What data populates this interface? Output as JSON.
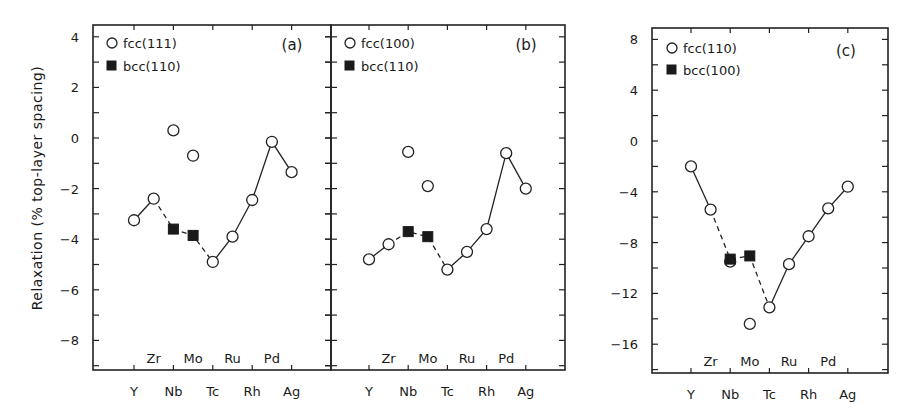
{
  "figure": {
    "ylabel": "Relaxation   (% top-layer spacing)"
  },
  "chart_data": [
    {
      "type": "scatter",
      "panel": "(a)",
      "title": "",
      "xlabel": "",
      "ylabel": "Relaxation (% top-layer spacing)",
      "x_categories_top_row": [
        "Zr",
        "Mo",
        "Ru",
        "Pd"
      ],
      "x_categories_bottom_row": [
        "Y",
        "Nb",
        "Tc",
        "Rh",
        "Ag"
      ],
      "element_order": [
        "Y",
        "Zr",
        "Nb",
        "Mo",
        "Tc",
        "Ru",
        "Rh",
        "Pd",
        "Ag"
      ],
      "yticks": [
        4,
        2,
        0,
        -2,
        -4,
        -6,
        -8
      ],
      "ylim": [
        -9.3,
        4.5
      ],
      "grid": false,
      "legend": [
        {
          "label": "fcc(111)",
          "marker": "open-circle"
        },
        {
          "label": "bcc(110)",
          "marker": "filled-square"
        }
      ],
      "series": [
        {
          "name": "fcc(111)",
          "marker": "open-circle",
          "points": [
            {
              "x": "Y",
              "y": -3.25
            },
            {
              "x": "Zr",
              "y": -2.4
            },
            {
              "x": "Nb",
              "y": 0.3
            },
            {
              "x": "Mo",
              "y": -0.7
            },
            {
              "x": "Tc",
              "y": -4.9
            },
            {
              "x": "Ru",
              "y": -3.9
            },
            {
              "x": "Rh",
              "y": -2.45
            },
            {
              "x": "Pd",
              "y": -0.15
            },
            {
              "x": "Ag",
              "y": -1.35
            }
          ]
        },
        {
          "name": "bcc(110)",
          "marker": "filled-square",
          "points": [
            {
              "x": "Nb",
              "y": -3.6
            },
            {
              "x": "Mo",
              "y": -3.85
            }
          ]
        }
      ],
      "lines": [
        {
          "style": "solid",
          "path": [
            [
              "Y",
              -3.25
            ],
            [
              "Zr",
              -2.4
            ]
          ]
        },
        {
          "style": "dashed",
          "path": [
            [
              "Zr",
              -2.4
            ],
            [
              "Nb",
              -3.6
            ],
            [
              "Mo",
              -3.85
            ],
            [
              "Tc",
              -4.9
            ]
          ]
        },
        {
          "style": "solid",
          "path": [
            [
              "Tc",
              -4.9
            ],
            [
              "Ru",
              -3.9
            ],
            [
              "Rh",
              -2.45
            ],
            [
              "Pd",
              -0.15
            ],
            [
              "Ag",
              -1.35
            ]
          ]
        }
      ]
    },
    {
      "type": "scatter",
      "panel": "(b)",
      "title": "",
      "xlabel": "",
      "ylabel": "",
      "x_categories_top_row": [
        "Zr",
        "Mo",
        "Ru",
        "Pd"
      ],
      "x_categories_bottom_row": [
        "Y",
        "Nb",
        "Tc",
        "Rh",
        "Ag"
      ],
      "element_order": [
        "Y",
        "Zr",
        "Nb",
        "Mo",
        "Tc",
        "Ru",
        "Rh",
        "Pd",
        "Ag"
      ],
      "yticks": [
        4,
        2,
        0,
        -2,
        -4,
        -6,
        -8
      ],
      "ylim": [
        -9.3,
        4.5
      ],
      "shares_y_with": "(a)",
      "grid": false,
      "legend": [
        {
          "label": "fcc(100)",
          "marker": "open-circle"
        },
        {
          "label": "bcc(110)",
          "marker": "filled-square"
        }
      ],
      "series": [
        {
          "name": "fcc(100)",
          "marker": "open-circle",
          "points": [
            {
              "x": "Y",
              "y": -4.8
            },
            {
              "x": "Zr",
              "y": -4.2
            },
            {
              "x": "Nb",
              "y": -0.55
            },
            {
              "x": "Mo",
              "y": -1.9
            },
            {
              "x": "Tc",
              "y": -5.2
            },
            {
              "x": "Ru",
              "y": -4.5
            },
            {
              "x": "Rh",
              "y": -3.6
            },
            {
              "x": "Pd",
              "y": -0.6
            },
            {
              "x": "Ag",
              "y": -2.0
            }
          ]
        },
        {
          "name": "bcc(110)",
          "marker": "filled-square",
          "points": [
            {
              "x": "Nb",
              "y": -3.7
            },
            {
              "x": "Mo",
              "y": -3.9
            }
          ]
        }
      ],
      "lines": [
        {
          "style": "solid",
          "path": [
            [
              "Y",
              -4.8
            ],
            [
              "Zr",
              -4.2
            ]
          ]
        },
        {
          "style": "dashed",
          "path": [
            [
              "Zr",
              -4.2
            ],
            [
              "Nb",
              -3.7
            ],
            [
              "Mo",
              -3.9
            ],
            [
              "Tc",
              -5.2
            ]
          ]
        },
        {
          "style": "solid",
          "path": [
            [
              "Tc",
              -5.2
            ],
            [
              "Ru",
              -4.5
            ],
            [
              "Rh",
              -3.6
            ],
            [
              "Pd",
              -0.6
            ],
            [
              "Ag",
              -2.0
            ]
          ]
        }
      ]
    },
    {
      "type": "scatter",
      "panel": "(c)",
      "title": "",
      "xlabel": "",
      "ylabel": "",
      "x_categories_top_row": [
        "Zr",
        "Mo",
        "Ru",
        "Pd"
      ],
      "x_categories_bottom_row": [
        "Y",
        "Nb",
        "Tc",
        "Rh",
        "Ag"
      ],
      "element_order": [
        "Y",
        "Zr",
        "Nb",
        "Mo",
        "Tc",
        "Ru",
        "Rh",
        "Pd",
        "Ag"
      ],
      "yticks": [
        8,
        4,
        0,
        -4,
        -8,
        -12,
        -16
      ],
      "ylim": [
        -18.4,
        8.8
      ],
      "grid": false,
      "legend": [
        {
          "label": "fcc(110)",
          "marker": "open-circle"
        },
        {
          "label": "bcc(100)",
          "marker": "filled-square"
        }
      ],
      "series": [
        {
          "name": "fcc(110)",
          "marker": "open-circle",
          "points": [
            {
              "x": "Y",
              "y": -2.0
            },
            {
              "x": "Zr",
              "y": -5.4
            },
            {
              "x": "Nb",
              "y": -9.5
            },
            {
              "x": "Mo",
              "y": -14.4
            },
            {
              "x": "Tc",
              "y": -13.1
            },
            {
              "x": "Ru",
              "y": -9.7
            },
            {
              "x": "Rh",
              "y": -7.5
            },
            {
              "x": "Pd",
              "y": -5.3
            },
            {
              "x": "Ag",
              "y": -3.6
            }
          ]
        },
        {
          "name": "bcc(100)",
          "marker": "filled-square",
          "points": [
            {
              "x": "Nb",
              "y": -9.3
            },
            {
              "x": "Mo",
              "y": -9.05
            }
          ]
        }
      ],
      "lines": [
        {
          "style": "solid",
          "path": [
            [
              "Y",
              -2.0
            ],
            [
              "Zr",
              -5.4
            ]
          ]
        },
        {
          "style": "dashed",
          "path": [
            [
              "Zr",
              -5.4
            ],
            [
              "Nb",
              -9.3
            ],
            [
              "Mo",
              -9.05
            ],
            [
              "Tc",
              -13.1
            ]
          ]
        },
        {
          "style": "solid",
          "path": [
            [
              "Tc",
              -13.1
            ],
            [
              "Ru",
              -9.7
            ],
            [
              "Rh",
              -7.5
            ],
            [
              "Pd",
              -5.3
            ],
            [
              "Ag",
              -3.6
            ]
          ]
        }
      ]
    }
  ],
  "layout": {
    "panels": [
      {
        "left": 93,
        "right": 331,
        "top": 25,
        "bottom": 370,
        "y_zero_px": 138,
        "px_per_unit": 25.3,
        "x0": 134,
        "dx": 19.7,
        "show_yticklabels": true,
        "tick_dir_left": "in",
        "tick_dir_right": "in",
        "legend_x": 112,
        "legend_y1": 47,
        "legend_y2": 70,
        "panel_label_x": 292,
        "panel_label_y": 50
      },
      {
        "left": 331,
        "right": 565,
        "top": 25,
        "bottom": 370,
        "y_zero_px": 138,
        "px_per_unit": 25.3,
        "x0": 369,
        "dx": 19.6,
        "show_yticklabels": false,
        "tick_dir_left": "both",
        "tick_dir_right": "in",
        "legend_x": 350,
        "legend_y1": 47,
        "legend_y2": 70,
        "panel_label_x": 526,
        "panel_label_y": 50
      },
      {
        "left": 652,
        "right": 888,
        "top": 28,
        "bottom": 373,
        "y_zero_px": 141,
        "px_per_unit": 12.7,
        "x0": 691,
        "dx": 19.6,
        "show_yticklabels": true,
        "tick_dir_left": "in",
        "tick_dir_right": "in",
        "legend_x": 672,
        "legend_y1": 52,
        "legend_y2": 74,
        "panel_label_x": 846,
        "panel_label_y": 56
      }
    ]
  }
}
